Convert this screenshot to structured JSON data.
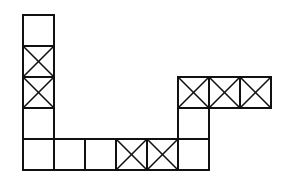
{
  "diagram": {
    "title": "",
    "cell_size": 31,
    "origin_x": 23,
    "origin_y": 18,
    "stroke_color": "#111111",
    "background_color": "#ffffff",
    "cells": [
      {
        "col": 0,
        "row": 0,
        "crossed": false
      },
      {
        "col": 0,
        "row": 1,
        "crossed": true
      },
      {
        "col": 0,
        "row": 2,
        "crossed": true
      },
      {
        "col": 0,
        "row": 3,
        "crossed": false
      },
      {
        "col": 0,
        "row": 4,
        "crossed": false
      },
      {
        "col": 1,
        "row": 4,
        "crossed": false
      },
      {
        "col": 2,
        "row": 4,
        "crossed": false
      },
      {
        "col": 3,
        "row": 4,
        "crossed": true
      },
      {
        "col": 4,
        "row": 4,
        "crossed": true
      },
      {
        "col": 5,
        "row": 4,
        "crossed": false
      },
      {
        "col": 5,
        "row": 3,
        "crossed": false
      },
      {
        "col": 5,
        "row": 2,
        "crossed": true
      },
      {
        "col": 6,
        "row": 2,
        "crossed": true
      },
      {
        "col": 7,
        "row": 2,
        "crossed": true
      }
    ]
  }
}
